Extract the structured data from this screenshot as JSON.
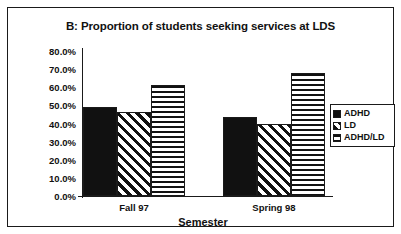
{
  "chart_data": {
    "type": "bar",
    "title": "B: Proportion of students seeking services at LDS",
    "xlabel": "Semester",
    "ylabel": "",
    "categories": [
      "Fall 97",
      "Spring 98"
    ],
    "series": [
      {
        "name": "ADHD",
        "pattern": "solid",
        "values": [
          49.0,
          43.5
        ]
      },
      {
        "name": "LD",
        "pattern": "diagonal",
        "values": [
          46.5,
          40.0
        ]
      },
      {
        "name": "ADHD/LD",
        "pattern": "horizontal",
        "values": [
          61.5,
          68.0
        ]
      }
    ],
    "ylim": [
      0,
      80
    ],
    "ytick_labels": [
      "80.0%",
      "70.0%",
      "60.0%",
      "50.0%",
      "40.0%",
      "30.0%",
      "20.0%",
      "10.0%",
      "0.0%"
    ],
    "ytick_values": [
      80,
      70,
      60,
      50,
      40,
      30,
      20,
      10,
      0
    ],
    "grid": false,
    "legend_position": "right",
    "colors": {
      "foreground": "#111111",
      "background": "#ffffff",
      "frame": "#1a1a1a"
    }
  },
  "legend": {
    "items": [
      {
        "label": "ADHD",
        "pattern": "solid"
      },
      {
        "label": "LD",
        "pattern": "diagonal"
      },
      {
        "label": "ADHD/LD",
        "pattern": "horizontal"
      }
    ]
  }
}
